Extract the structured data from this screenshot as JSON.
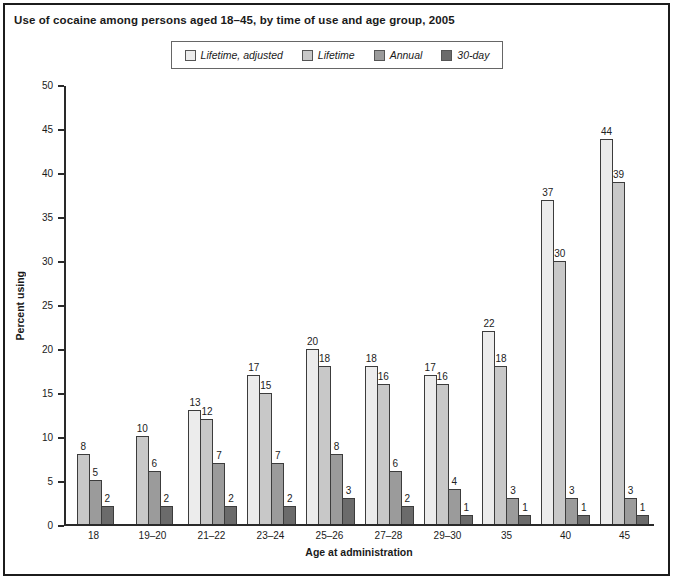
{
  "title": "Use of cocaine among persons aged 18–45, by time of use and age group, 2005",
  "legend": {
    "position": "top-center",
    "items": [
      {
        "label": "Lifetime, adjusted",
        "color": "#ececec"
      },
      {
        "label": "Lifetime",
        "color": "#c8c8c8"
      },
      {
        "label": "Annual",
        "color": "#9b9b9b"
      },
      {
        "label": "30-day",
        "color": "#6b6b6b"
      }
    ]
  },
  "chart_data": {
    "type": "bar",
    "title": "Use of cocaine among persons aged 18–45, by time of use and age group, 2005",
    "xlabel": "Age at administration",
    "ylabel": "Percent using",
    "ylim": [
      0,
      50
    ],
    "yticks": [
      0,
      5,
      10,
      15,
      20,
      25,
      30,
      35,
      40,
      45,
      50
    ],
    "grid": false,
    "legend_position": "top-center",
    "axis_color": "#2a2a2a",
    "bar_outline_color": "#3c3c3c",
    "categories": [
      "18",
      "19–20",
      "21–22",
      "23–24",
      "25–26",
      "27–28",
      "29–30",
      "35",
      "40",
      "45"
    ],
    "series": [
      {
        "name": "Lifetime, adjusted",
        "color": "#ececec",
        "values": [
          null,
          null,
          13,
          17,
          20,
          18,
          17,
          22,
          37,
          44
        ]
      },
      {
        "name": "Lifetime",
        "color": "#c8c8c8",
        "values": [
          8,
          10,
          12,
          15,
          18,
          16,
          16,
          18,
          30,
          39
        ]
      },
      {
        "name": "Annual",
        "color": "#9b9b9b",
        "values": [
          5,
          6,
          7,
          7,
          8,
          6,
          4,
          3,
          3,
          3
        ]
      },
      {
        "name": "30-day",
        "color": "#6b6b6b",
        "values": [
          2,
          2,
          2,
          2,
          3,
          2,
          1,
          1,
          1,
          1
        ]
      }
    ]
  }
}
